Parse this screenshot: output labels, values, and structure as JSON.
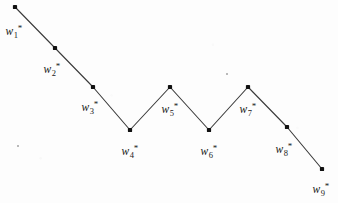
{
  "figure": {
    "width": 338,
    "height": 203,
    "background_color": "#fdfdfd",
    "ink_color": "#1a1a1a",
    "line_color": "#3a3a3a"
  },
  "chart_data": {
    "type": "line",
    "title": "",
    "xlabel": "",
    "ylabel": "",
    "grid": false,
    "legend": null,
    "axis_visible": false,
    "xlim": [
      0,
      338
    ],
    "ylim": [
      203,
      0
    ],
    "marker": "square-dot",
    "marker_color": "#111111",
    "line_color": "#3a3a3a",
    "line_width": 1.1,
    "point_labels": [
      "w1*",
      "w2*",
      "w3*",
      "w4*",
      "w5*",
      "w6*",
      "w7*",
      "w8*",
      "w9*"
    ],
    "points": [
      {
        "id": 1,
        "label_base": "w",
        "sub": "1",
        "sup": "*",
        "x": 15,
        "y": 7,
        "label_x": 14,
        "label_y": 32
      },
      {
        "id": 2,
        "label_base": "w",
        "sub": "2",
        "sup": "*",
        "x": 55,
        "y": 48,
        "label_x": 52,
        "label_y": 70
      },
      {
        "id": 3,
        "label_base": "w",
        "sub": "3",
        "sup": "*",
        "x": 93,
        "y": 87,
        "label_x": 90,
        "label_y": 108
      },
      {
        "id": 4,
        "label_base": "w",
        "sub": "4",
        "sup": "*",
        "x": 130,
        "y": 130,
        "label_x": 130,
        "label_y": 152
      },
      {
        "id": 5,
        "label_base": "w",
        "sub": "5",
        "sup": "*",
        "x": 170,
        "y": 87,
        "label_x": 170,
        "label_y": 110
      },
      {
        "id": 6,
        "label_base": "w",
        "sub": "6",
        "sup": "*",
        "x": 209,
        "y": 130,
        "label_x": 209,
        "label_y": 152
      },
      {
        "id": 7,
        "label_base": "w",
        "sub": "7",
        "sup": "*",
        "x": 248,
        "y": 87,
        "label_x": 248,
        "label_y": 110
      },
      {
        "id": 8,
        "label_base": "w",
        "sub": "8",
        "sup": "*",
        "x": 287,
        "y": 127,
        "label_x": 284,
        "label_y": 150
      },
      {
        "id": 9,
        "label_base": "w",
        "sub": "9",
        "sup": "*",
        "x": 322,
        "y": 169,
        "label_x": 321,
        "label_y": 190
      }
    ],
    "x": [
      15,
      55,
      93,
      130,
      170,
      209,
      248,
      287,
      322
    ],
    "values": [
      7,
      48,
      87,
      130,
      87,
      130,
      87,
      127,
      169
    ]
  },
  "artifacts": [
    {
      "name": "speck",
      "x": 226,
      "y": 73
    },
    {
      "name": "speck",
      "x": 17,
      "y": 145
    }
  ]
}
